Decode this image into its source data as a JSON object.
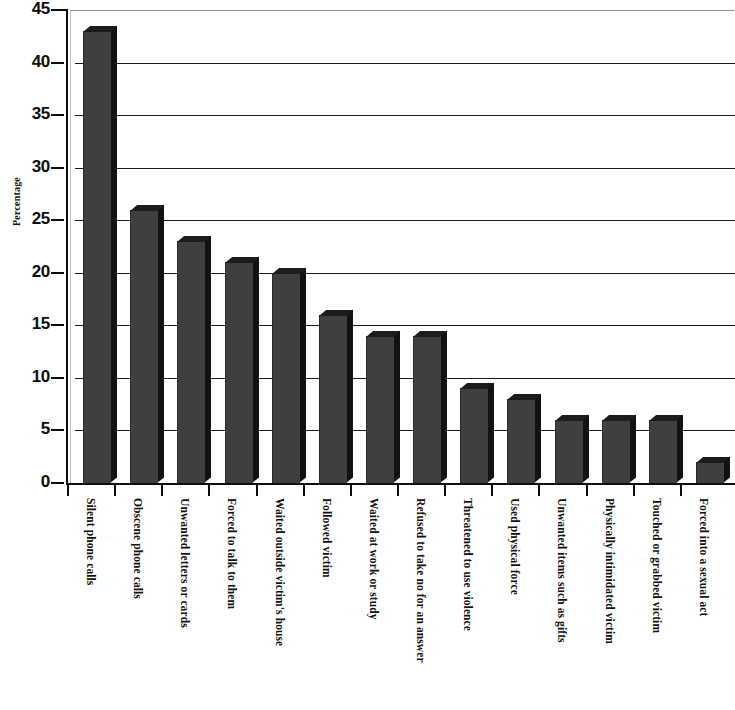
{
  "chart_data": {
    "type": "bar",
    "title": "",
    "subtitle": "",
    "xlabel": "",
    "ylabel": "Percentage",
    "ylim": [
      0,
      45
    ],
    "ytick_step": 5,
    "yticks": [
      45,
      40,
      35,
      30,
      25,
      20,
      15,
      10,
      5,
      0
    ],
    "grid": true,
    "legend": null,
    "orientation": "vertical",
    "bar_style": "3d-shaded",
    "bar_color": "#3f3f3f",
    "bar_side_color": "#121212",
    "bar_top_color": "#1c1c1c",
    "plot_background": "#ffffff",
    "gridline_color": "#1a1a1a",
    "axis_color": "#0d0d0d",
    "note": "right-most bar is cropped by the image edge",
    "categories": [
      "Silent phone calls",
      "Obscene phone calls",
      "Unwanted letters or cards",
      "Forced to talk to them",
      "Waited outside victim's house",
      "Followed victim",
      "Waited at work or study",
      "Refused to take no for an answer",
      "Threatened to use violence",
      "Used physical force",
      "Unwanted items such as gifts",
      "Physically intimidated victim",
      "Touched or grabbed victim",
      "Forced into a sexual act"
    ],
    "values": [
      43,
      26,
      23,
      21,
      20,
      16,
      14,
      14,
      9,
      8,
      6,
      6,
      6,
      2
    ]
  }
}
